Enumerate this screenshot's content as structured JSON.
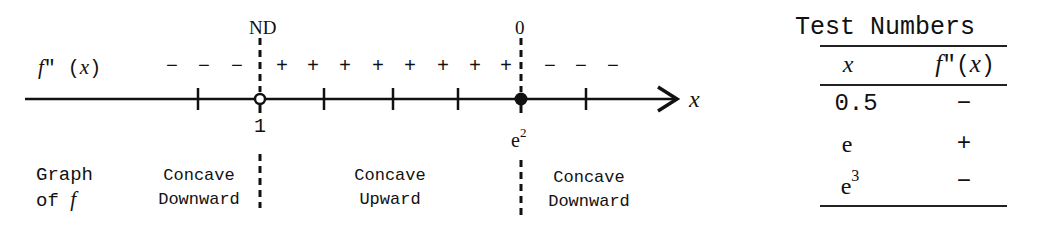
{
  "number_line": {
    "function_label": "f\"(x)",
    "axis_label": "x",
    "critical_points": [
      {
        "x_label": "1",
        "value_label": "ND",
        "marker": "open-circle"
      },
      {
        "x_label": "e",
        "x_label_sup": "2",
        "value_label": "0",
        "marker": "filled-dot"
      }
    ],
    "sign_intervals": [
      {
        "signs": [
          "−",
          "−",
          "−"
        ],
        "sign": "negative"
      },
      {
        "signs": [
          "+",
          "+",
          "+",
          "+",
          "+",
          "+",
          "+",
          "+"
        ],
        "sign": "positive"
      },
      {
        "signs": [
          "−",
          "−",
          "−"
        ],
        "sign": "negative"
      }
    ]
  },
  "graph_row": {
    "label_line1": "Graph",
    "label_line2_prefix": "of",
    "label_line2_var": "f",
    "regions": [
      {
        "line1": "Concave",
        "line2": "Downward"
      },
      {
        "line1": "Concave",
        "line2": "Upward"
      },
      {
        "line1": "Concave",
        "line2": "Downward"
      }
    ]
  },
  "test_table": {
    "title": "Test Numbers",
    "headers": [
      "x",
      "f\"(x)"
    ],
    "rows": [
      {
        "x": "0.5",
        "x_sup": "",
        "sign": "−"
      },
      {
        "x": "e",
        "x_sup": "",
        "sign": "+"
      },
      {
        "x": "e",
        "x_sup": "3",
        "sign": "−"
      }
    ]
  }
}
